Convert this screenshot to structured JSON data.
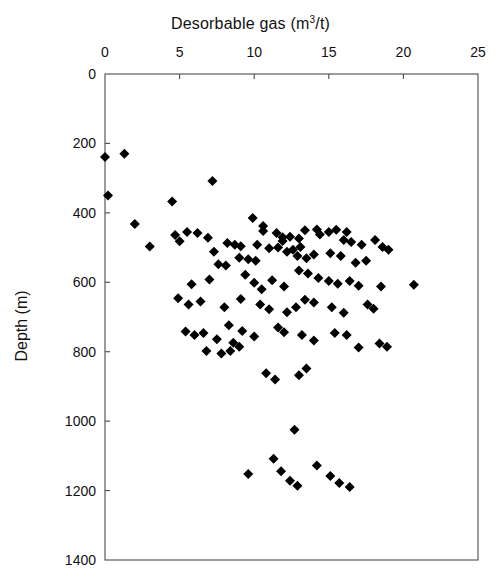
{
  "figure": {
    "title_prefix": "Desorbable gas (m",
    "title_sup": "3",
    "title_suffix": "/t)",
    "title_full": "Desorbable gas (m3/t)",
    "ylabel": "Depth (m)",
    "background": "#ffffff",
    "marker_color": "#000000",
    "frame_color": "#4c4c4c"
  },
  "axes": {
    "x_ticks": [
      "0",
      "5",
      "10",
      "15",
      "20",
      "25"
    ],
    "y_ticks": [
      "0",
      "200",
      "400",
      "600",
      "800",
      "1000",
      "1200",
      "1400"
    ],
    "x_position": "top",
    "y_position": "left",
    "y_inverted": true
  },
  "chart_data": {
    "type": "scatter",
    "title": "Desorbable gas (m3/t)",
    "xlabel": "Desorbable gas (m3/t)",
    "ylabel": "Depth (m)",
    "xlim": [
      0,
      25
    ],
    "ylim": [
      1400,
      0
    ],
    "y_inverted": true,
    "grid": false,
    "legend": false,
    "marker": "diamond",
    "marker_color": "#000000",
    "marker_size": 5,
    "n_points": 118,
    "series": [
      {
        "name": "Desorbable gas samples",
        "points": [
          [
            0.0,
            239
          ],
          [
            1.3,
            230
          ],
          [
            0.2,
            350
          ],
          [
            2.0,
            432
          ],
          [
            4.7,
            464
          ],
          [
            5.5,
            455
          ],
          [
            6.2,
            458
          ],
          [
            5.0,
            482
          ],
          [
            4.5,
            367
          ],
          [
            7.2,
            308
          ],
          [
            3.0,
            497
          ],
          [
            6.9,
            472
          ],
          [
            7.3,
            512
          ],
          [
            8.2,
            487
          ],
          [
            8.7,
            492
          ],
          [
            9.1,
            496
          ],
          [
            9.9,
            415
          ],
          [
            10.6,
            438
          ],
          [
            10.6,
            452
          ],
          [
            11.5,
            458
          ],
          [
            11.9,
            470
          ],
          [
            11.9,
            481
          ],
          [
            10.2,
            492
          ],
          [
            11.0,
            502
          ],
          [
            11.6,
            500
          ],
          [
            12.2,
            512
          ],
          [
            12.6,
            506
          ],
          [
            13.1,
            498
          ],
          [
            13.4,
            450
          ],
          [
            14.2,
            448
          ],
          [
            14.4,
            462
          ],
          [
            15.0,
            455
          ],
          [
            15.5,
            449
          ],
          [
            16.2,
            455
          ],
          [
            16.0,
            478
          ],
          [
            16.5,
            484
          ],
          [
            17.2,
            492
          ],
          [
            18.1,
            478
          ],
          [
            18.6,
            498
          ],
          [
            19.0,
            506
          ],
          [
            12.4,
            469
          ],
          [
            13.0,
            474
          ],
          [
            9.0,
            529
          ],
          [
            9.6,
            534
          ],
          [
            10.1,
            538
          ],
          [
            7.6,
            548
          ],
          [
            8.1,
            552
          ],
          [
            12.9,
            524
          ],
          [
            13.5,
            531
          ],
          [
            14.0,
            520
          ],
          [
            15.1,
            516
          ],
          [
            15.8,
            524
          ],
          [
            16.8,
            544
          ],
          [
            17.5,
            538
          ],
          [
            5.8,
            606
          ],
          [
            7.0,
            592
          ],
          [
            9.4,
            578
          ],
          [
            10.0,
            601
          ],
          [
            10.5,
            620
          ],
          [
            11.2,
            594
          ],
          [
            12.0,
            612
          ],
          [
            13.0,
            566
          ],
          [
            13.6,
            575
          ],
          [
            14.3,
            588
          ],
          [
            15.0,
            596
          ],
          [
            15.6,
            604
          ],
          [
            16.4,
            596
          ],
          [
            17.0,
            610
          ],
          [
            18.5,
            612
          ],
          [
            20.7,
            607
          ],
          [
            4.9,
            646
          ],
          [
            5.6,
            664
          ],
          [
            6.4,
            655
          ],
          [
            8.0,
            672
          ],
          [
            9.1,
            648
          ],
          [
            10.4,
            664
          ],
          [
            11.0,
            678
          ],
          [
            12.2,
            686
          ],
          [
            12.8,
            672
          ],
          [
            13.4,
            650
          ],
          [
            14.0,
            658
          ],
          [
            15.2,
            672
          ],
          [
            16.0,
            688
          ],
          [
            17.6,
            664
          ],
          [
            18.0,
            676
          ],
          [
            5.4,
            742
          ],
          [
            6.0,
            752
          ],
          [
            6.6,
            746
          ],
          [
            7.5,
            764
          ],
          [
            8.3,
            724
          ],
          [
            9.2,
            740
          ],
          [
            10.0,
            756
          ],
          [
            11.6,
            730
          ],
          [
            12.0,
            744
          ],
          [
            13.2,
            752
          ],
          [
            14.0,
            768
          ],
          [
            15.4,
            746
          ],
          [
            16.2,
            752
          ],
          [
            17.0,
            788
          ],
          [
            18.4,
            776
          ],
          [
            18.9,
            786
          ],
          [
            10.8,
            862
          ],
          [
            11.4,
            880
          ],
          [
            13.5,
            848
          ],
          [
            13.0,
            868
          ],
          [
            12.7,
            1025
          ],
          [
            9.6,
            1152
          ],
          [
            11.3,
            1108
          ],
          [
            11.8,
            1144
          ],
          [
            12.4,
            1172
          ],
          [
            12.9,
            1186
          ],
          [
            14.2,
            1128
          ],
          [
            15.1,
            1158
          ],
          [
            15.7,
            1178
          ],
          [
            16.4,
            1190
          ],
          [
            8.6,
            774
          ],
          [
            9.0,
            786
          ],
          [
            7.8,
            805
          ],
          [
            8.4,
            798
          ],
          [
            6.8,
            798
          ]
        ]
      }
    ]
  }
}
